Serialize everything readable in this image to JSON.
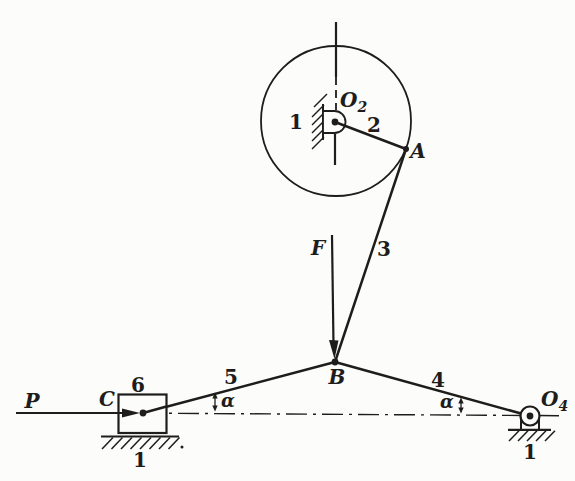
{
  "figure": {
    "ink_color": "#1e1d1b",
    "paper_color": "#fcfcfa"
  },
  "labels": {
    "crank_ground": "1",
    "crank_pivot": {
      "base": "O",
      "sub": "2"
    },
    "crank_link": "2",
    "joint_a": "A",
    "coupler_link": "3",
    "force_f": "F",
    "joint_b": "B",
    "left_link": "5",
    "right_link": "4",
    "slider_block": "6",
    "joint_c": "C",
    "force_p": "P",
    "alpha_left": "α",
    "alpha_right": "α",
    "slider_ground": "1",
    "rocker_pivot": {
      "base": "O",
      "sub": "4"
    },
    "rocker_ground": "1"
  }
}
